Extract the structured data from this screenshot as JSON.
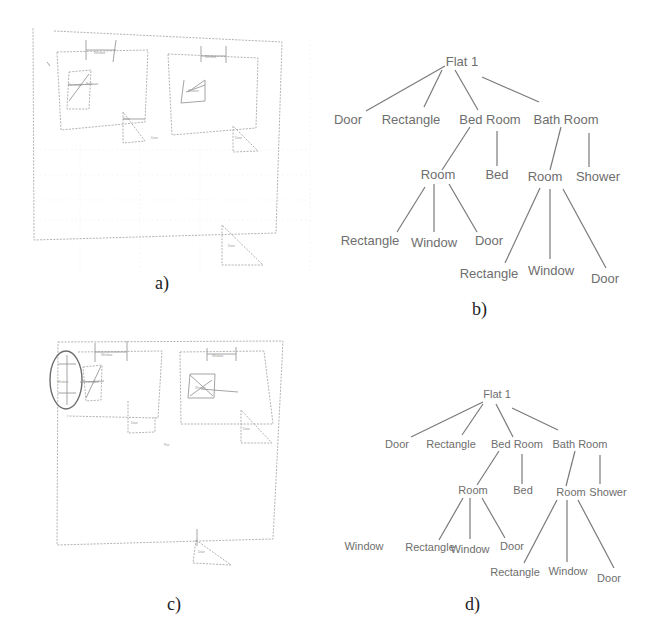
{
  "figure": {
    "panels": [
      {
        "id": "a",
        "caption": "a)",
        "type": "sketch",
        "sketch_labels": [
          "Window",
          "Window",
          "Rectangle",
          "Bed",
          "Shower",
          "Door",
          "Door",
          "Door",
          "Door"
        ]
      },
      {
        "id": "b",
        "caption": "b)",
        "type": "tree",
        "root": "Flat 1",
        "level1": [
          "Door",
          "Rectangle",
          "Bed Room",
          "Bath Room"
        ],
        "bedroom_children": [
          "Room",
          "Bed"
        ],
        "bathroom_children": [
          "Room",
          "Shower"
        ],
        "bedroom_room_children": [
          "Rectangle",
          "Window",
          "Door"
        ],
        "bathroom_room_children": [
          "Rectangle",
          "Window",
          "Door"
        ]
      },
      {
        "id": "c",
        "caption": "c)",
        "type": "sketch",
        "sketch_labels": [
          "Window",
          "Window",
          "Window",
          "Rectangle",
          "Bed",
          "Shower",
          "Door",
          "Door",
          "Flat",
          "Door"
        ]
      },
      {
        "id": "d",
        "caption": "d)",
        "type": "tree",
        "root": "Flat 1",
        "level1": [
          "Door",
          "Rectangle",
          "Bed Room",
          "Bath Room"
        ],
        "bedroom_children": [
          "Room",
          "Bed"
        ],
        "bathroom_children": [
          "Room",
          "Shower"
        ],
        "bedroom_room_children": [
          "Window",
          "Rectangle",
          "Window",
          "Door"
        ],
        "bathroom_room_children": [
          "Rectangle",
          "Window",
          "Door"
        ]
      }
    ]
  }
}
